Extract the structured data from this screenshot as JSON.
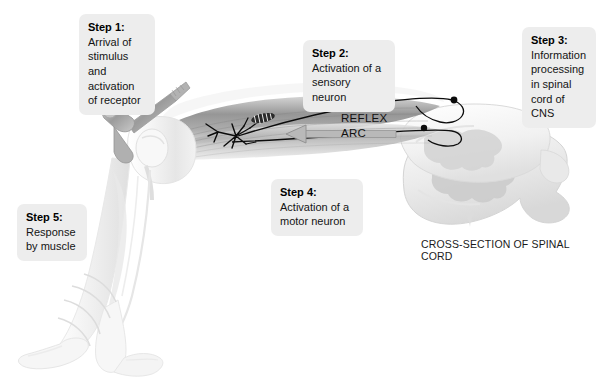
{
  "figure": {
    "background_color": "#ffffff",
    "width": 598,
    "height": 384,
    "title_text": "REFLEX ARC",
    "caption": "CROSS-SECTION OF SPINAL CORD"
  },
  "labels": {
    "reflex_arc": "REFLEX\nARC",
    "cross_section": "CROSS-SECTION OF SPINAL CORD"
  },
  "steps": [
    {
      "id": "step-1",
      "head": "Step 1:",
      "body": "Arrival of\nstimulus and\nactivation\nof receptor"
    },
    {
      "id": "step-2",
      "head": "Step 2:",
      "body": "Activation of a\nsensory neuron"
    },
    {
      "id": "step-3",
      "head": "Step 3:",
      "body": "Information\nprocessing\nin spinal\ncord of CNS"
    },
    {
      "id": "step-4",
      "head": "Step 4:",
      "body": "Activation of a\nmotor neuron"
    },
    {
      "id": "step-5",
      "head": "Step 5:",
      "body": "Response\nby muscle"
    }
  ],
  "colors": {
    "callout_background": "#ededed",
    "text": "#141414",
    "nerve_line": "#0c0c0c",
    "arrow_fill": "#b9b9b9",
    "arrow_stroke": "#8a8a8a",
    "skin_light": "#f4f4f4",
    "skin_shadow": "#d9d9d9",
    "muscle_dark": "#8e8e8e",
    "muscle_mid": "#b5b5b5",
    "cord_outline": "#d2d2d2",
    "cord_gray_matter": "#cfcfcf",
    "hammer_metal": "#a9a9a9"
  },
  "anatomy": {
    "parts": [
      "reflex-hammer",
      "thigh-muscle",
      "knee-joint",
      "lower-leg",
      "foot-resting",
      "foot-kicking",
      "motion-lines",
      "muscle-spindle-receptor",
      "sensory-neuron-fiber",
      "motor-neuron-fiber",
      "dorsal-root-ganglion",
      "spinal-cord-cross-section",
      "gray-matter-butterfly"
    ]
  }
}
